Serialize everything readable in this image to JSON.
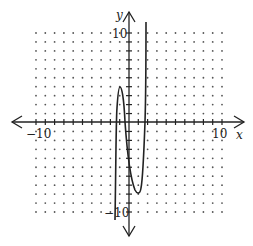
{
  "chart_data": {
    "type": "line",
    "title": "",
    "xlabel": "x",
    "ylabel": "y",
    "xlim": [
      -10,
      10
    ],
    "ylim": [
      -10,
      10
    ],
    "grid": "dotted points at every integer",
    "tick_labels": {
      "x": [
        "-10",
        "10"
      ],
      "y": [
        "10",
        "-10"
      ]
    },
    "series": [
      {
        "name": "f(x)",
        "description": "cubic-like curve: rises from below, local max near (-1, 4), local min near (1, -7.5), then rises steeply",
        "points": [
          [
            -1.5,
            -10.5
          ],
          [
            -1.3,
            0
          ],
          [
            -0.95,
            3.8
          ],
          [
            -0.4,
            0
          ],
          [
            0,
            -3
          ],
          [
            0.5,
            -6
          ],
          [
            1.0,
            -7.5
          ],
          [
            1.4,
            -4
          ],
          [
            1.8,
            0
          ],
          [
            1.85,
            11
          ]
        ]
      }
    ]
  },
  "labels": {
    "x_axis": "x",
    "y_axis": "y",
    "x_min": "−10",
    "x_max": "10",
    "y_max": "10",
    "y_min": "−10"
  },
  "colors": {
    "axis": "#222222",
    "curve": "#222222",
    "grid_dot": "#555555"
  }
}
